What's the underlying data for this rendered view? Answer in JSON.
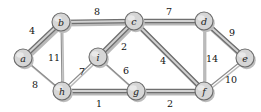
{
  "figure": {
    "type": "weighted-undirected-graph",
    "title": "",
    "background": "#ffffff",
    "width": 261,
    "height": 112
  },
  "colors": {
    "node_fill": "#d6d6d6",
    "node_stroke": "#6b6b6b",
    "edge_normal": "#8d8d8d",
    "edge_highlight": "#6f6f6f",
    "edge_highlight_fill": "#d2d2d2",
    "shadow": "#bdbdbd",
    "label_text": "#111111"
  },
  "chart_data": {
    "type": "diagram",
    "title": "",
    "xlabel": "",
    "ylabel": "",
    "nodes": [
      {
        "id": "a",
        "label": "a",
        "x": 23,
        "y": 58,
        "r": 9
      },
      {
        "id": "b",
        "label": "b",
        "x": 61,
        "y": 22,
        "r": 9
      },
      {
        "id": "c",
        "label": "c",
        "x": 134,
        "y": 21,
        "r": 9
      },
      {
        "id": "d",
        "label": "d",
        "x": 204,
        "y": 21,
        "r": 9
      },
      {
        "id": "e",
        "label": "e",
        "x": 245,
        "y": 58,
        "r": 9
      },
      {
        "id": "f",
        "label": "f",
        "x": 204,
        "y": 91,
        "r": 9
      },
      {
        "id": "g",
        "label": "g",
        "x": 136,
        "y": 91,
        "r": 9
      },
      {
        "id": "h",
        "label": "h",
        "x": 62,
        "y": 91,
        "r": 9
      },
      {
        "id": "i",
        "label": "i",
        "x": 98,
        "y": 57,
        "r": 9
      }
    ],
    "edges": [
      {
        "source": "a",
        "target": "b",
        "weight": 4,
        "highlighted": true,
        "label_x": 32,
        "label_y": 30
      },
      {
        "source": "a",
        "target": "h",
        "weight": 8,
        "highlighted": false,
        "label_x": 35,
        "label_y": 84
      },
      {
        "source": "b",
        "target": "c",
        "weight": 8,
        "highlighted": true,
        "label_x": 97,
        "label_y": 11
      },
      {
        "source": "b",
        "target": "h",
        "weight": 11,
        "highlighted": false,
        "label_x": 54,
        "label_y": 57
      },
      {
        "source": "c",
        "target": "d",
        "weight": 7,
        "highlighted": true,
        "label_x": 169,
        "label_y": 11
      },
      {
        "source": "c",
        "target": "i",
        "weight": 2,
        "highlighted": true,
        "label_x": 124,
        "label_y": 46
      },
      {
        "source": "c",
        "target": "f",
        "weight": 4,
        "highlighted": true,
        "label_x": 163,
        "label_y": 60
      },
      {
        "source": "d",
        "target": "e",
        "weight": 9,
        "highlighted": true,
        "label_x": 232,
        "label_y": 32
      },
      {
        "source": "d",
        "target": "f",
        "weight": 14,
        "highlighted": false,
        "label_x": 212,
        "label_y": 58
      },
      {
        "source": "e",
        "target": "f",
        "weight": 10,
        "highlighted": false,
        "label_x": 231,
        "label_y": 79
      },
      {
        "source": "f",
        "target": "g",
        "weight": 2,
        "highlighted": true,
        "label_x": 170,
        "label_y": 103
      },
      {
        "source": "g",
        "target": "h",
        "weight": 1,
        "highlighted": true,
        "label_x": 99,
        "label_y": 103
      },
      {
        "source": "g",
        "target": "i",
        "weight": 6,
        "highlighted": false,
        "label_x": 126,
        "label_y": 70
      },
      {
        "source": "h",
        "target": "i",
        "weight": 7,
        "highlighted": false,
        "label_x": 82,
        "label_y": 71
      }
    ],
    "highlighted_edge_set": [
      "a-b",
      "b-c",
      "c-d",
      "c-i",
      "c-f",
      "d-e",
      "f-g",
      "g-h"
    ],
    "legend": [],
    "annotations": []
  }
}
